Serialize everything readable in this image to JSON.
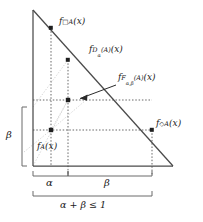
{
  "figure": {
    "type": "diagram",
    "kind": "triangle-membership-diagram",
    "canvas": {
      "width": 203,
      "height": 222,
      "background": "#ffffff"
    },
    "colors": {
      "stroke": "#4a4a4a",
      "dotted_dark": "#4a4a4a",
      "dotted_light": "#c8c8c8",
      "text": "#1a1a1a"
    },
    "triangle": {
      "apex": [
        33,
        10
      ],
      "bottom_left": [
        33,
        166
      ],
      "bottom_right": [
        173,
        166
      ]
    },
    "points": [
      {
        "name": "box-A-point",
        "x": 51,
        "y": 28,
        "label": "f_box_A"
      },
      {
        "name": "D-alpha-A-point",
        "x": 68,
        "y": 60,
        "label": "f_D_alpha_A"
      },
      {
        "name": "F-alpha-beta-point",
        "x": 68,
        "y": 100,
        "label": "f_F_alpha_beta_A"
      },
      {
        "name": "A-point",
        "x": 51,
        "y": 130,
        "label": "f_A"
      },
      {
        "name": "diamond-A-point",
        "x": 152,
        "y": 130,
        "label": "f_diamond_A"
      }
    ],
    "labels": {
      "f_box_A": {
        "f": "f",
        "sub_pre": "□",
        "sub": "A",
        "arg": "(x)"
      },
      "f_D_alpha_A": {
        "f": "f",
        "sub": "D",
        "sub_arg": "α",
        "sub_paren": "(A)",
        "arg": "(x)"
      },
      "f_F_alpha_beta_A": {
        "f": "f",
        "sub": "F",
        "sub_arg": "α,β",
        "sub_paren": "(A)",
        "arg": "(x)"
      },
      "f_diamond_A": {
        "f": "f",
        "sub_pre": "◇",
        "sub": "A",
        "arg": "(x)"
      },
      "f_A": {
        "f": "f",
        "sub": "A",
        "arg": "(x)"
      }
    },
    "brackets": {
      "left_vertical": {
        "label": "β",
        "from_y": 107,
        "to_y": 166,
        "x": 22
      },
      "bottom_alpha": {
        "label": "α",
        "from_x": 33,
        "to_x": 68,
        "y": 176
      },
      "bottom_beta": {
        "label": "β",
        "from_x": 68,
        "to_x": 152,
        "y": 176
      },
      "bottom_total": {
        "label": "α + β ≤ 1",
        "from_x": 33,
        "to_x": 152,
        "y": 196
      }
    },
    "arrow": {
      "from": [
        115,
        86
      ],
      "to": [
        78,
        99
      ],
      "points_to": "f_F_alpha_beta_A"
    }
  }
}
